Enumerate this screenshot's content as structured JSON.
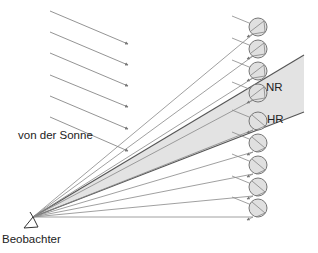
{
  "labels": {
    "sun": "von der Sonne",
    "observer": "Beobachter",
    "secondary_rainbow": "NR",
    "primary_rainbow": "HR"
  },
  "colors": {
    "ray": "#888888",
    "band_fill": "#e3e3e3",
    "band_edge": "#555555",
    "drop_fill": "#e0e0e0",
    "drop_stroke": "#777777",
    "text": "#222222"
  },
  "observer": {
    "x": 33,
    "y": 217
  },
  "sun_rays": [
    {
      "x1": 50,
      "y1": 11,
      "x2": 128,
      "y2": 44
    },
    {
      "x1": 50,
      "y1": 32,
      "x2": 128,
      "y2": 65
    },
    {
      "x1": 50,
      "y1": 53,
      "x2": 128,
      "y2": 86
    },
    {
      "x1": 50,
      "y1": 75,
      "x2": 128,
      "y2": 107
    },
    {
      "x1": 50,
      "y1": 96,
      "x2": 128,
      "y2": 129
    },
    {
      "x1": 50,
      "y1": 117,
      "x2": 128,
      "y2": 151
    }
  ],
  "drops": [
    {
      "cx": 258,
      "cy": 27,
      "group": "upper"
    },
    {
      "cx": 258,
      "cy": 49,
      "group": "upper"
    },
    {
      "cx": 258,
      "cy": 71,
      "group": "upper"
    },
    {
      "cx": 258,
      "cy": 93,
      "group": "upper"
    },
    {
      "cx": 258,
      "cy": 121,
      "group": "lower"
    },
    {
      "cx": 258,
      "cy": 143,
      "group": "lower"
    },
    {
      "cx": 258,
      "cy": 165,
      "group": "lower"
    },
    {
      "cx": 258,
      "cy": 187,
      "group": "lower"
    },
    {
      "cx": 258,
      "cy": 208,
      "group": "lower"
    }
  ],
  "band": {
    "upper_end": {
      "x": 304,
      "y": 55
    },
    "lower_end": {
      "x": 304,
      "y": 112
    }
  }
}
